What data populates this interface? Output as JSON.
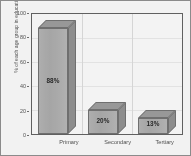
{
  "chart_data": {
    "type": "bar",
    "title": "",
    "subtitle": "",
    "xlabel": "",
    "ylabel": "% of each age group in education",
    "categories": [
      "Primary",
      "Secondary",
      "Tertiary"
    ],
    "values": [
      88,
      20,
      13
    ],
    "data_labels": [
      "88%",
      "20%",
      "13%"
    ],
    "ylim": [
      0,
      100
    ],
    "yticks": [
      0,
      20,
      40,
      60,
      80,
      100
    ],
    "ytick_labels": [
      "0",
      "20",
      "40",
      "60",
      "80",
      "100"
    ],
    "grid": "vertical-light",
    "legend": "none",
    "style": "3d-bar-grayscale",
    "series": [
      {
        "name": "% of each age group in education",
        "values": [
          88,
          20,
          13
        ]
      }
    ],
    "colors": {
      "bar_front": "#ACACAC",
      "bar_top": "#9A9A9A",
      "bar_side": "#8E8E8E",
      "bar_outline": "#6E6E6E",
      "axis": "#5D5D5D",
      "grid": "#DCDCDC",
      "text": "#4A4A4A",
      "label_text": "#1D1D1D",
      "frame": "#8C8C8C",
      "background": "#FCFCFC"
    }
  }
}
